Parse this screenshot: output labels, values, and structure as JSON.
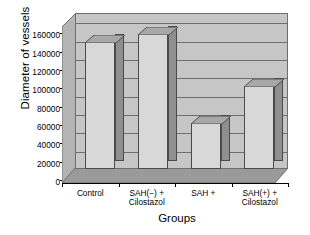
{
  "chart_data": {
    "type": "bar",
    "title": "",
    "subtitle": "",
    "xlabel": "Groups",
    "ylabel": "Diameter of vessels",
    "categories": [
      "Control",
      "SAH(−) +\nCilostazol",
      "SAH +",
      "SAH(+) +\nCilostazol"
    ],
    "category_lines": [
      [
        "Control"
      ],
      [
        "SAH(−) +",
        "Cilostazol"
      ],
      [
        "SAH +"
      ],
      [
        "SAH(+) +",
        "Cilostazol"
      ]
    ],
    "values": [
      138000,
      147000,
      50000,
      90000
    ],
    "ylim": [
      0,
      170000
    ],
    "ytick_values": [
      0,
      20000,
      40000,
      60000,
      80000,
      100000,
      120000,
      140000,
      160000
    ],
    "ytick_labels": [
      "0",
      "20000",
      "40000",
      "60000",
      "80000",
      "100000",
      "120000",
      "140000",
      "160000"
    ],
    "grid": true,
    "grid_axis": "y",
    "legend": false,
    "legend_position": "none",
    "style": "3d-column",
    "series": [
      {
        "name": "Diameter of vessels",
        "values": [
          138000,
          147000,
          50000,
          90000
        ]
      }
    ],
    "annotations": []
  },
  "axes": {
    "y_title": "Diameter of vessels",
    "x_title": "Groups"
  },
  "colors": {
    "bar_face": "#d8d8d8",
    "bar_side": "#8f8f8f",
    "bar_top": "#a8a8a8",
    "bar_outline": "#4a4a4a",
    "wall": "#c6c6c6",
    "wall_side": "#b4b4b4",
    "floor": "#9a9a9a",
    "gridline": "#6e6e6e",
    "axis": "#000000",
    "background": "#ffffff",
    "text": "#000000"
  }
}
